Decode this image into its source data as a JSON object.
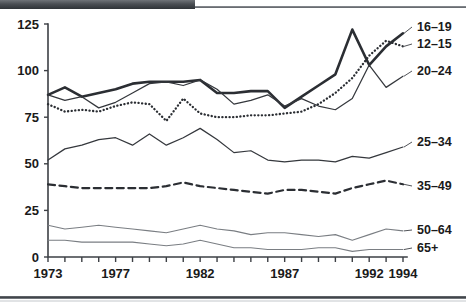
{
  "figure": {
    "title": "",
    "y_axis": {
      "ticks": [
        "0",
        "25",
        "50",
        "75",
        "100",
        "125"
      ],
      "min": 0,
      "max": 125
    },
    "x_axis": {
      "labeled_ticks": [
        "1973",
        "1977",
        "1982",
        "1987",
        "1992",
        "1994"
      ],
      "min": 1973,
      "max": 1994
    },
    "legend": [
      {
        "label": "16–19"
      },
      {
        "label": "12–15"
      },
      {
        "label": "20–24"
      },
      {
        "label": "25–34"
      },
      {
        "label": "35–49"
      },
      {
        "label": "50–64"
      },
      {
        "label": "65+"
      }
    ],
    "colors": {
      "ink": "#1a1a1a",
      "axis": "#3d4045",
      "light_line": "#6d7176",
      "background": "#ffffff"
    }
  },
  "chart_data": {
    "type": "line",
    "title": "",
    "xlabel": "",
    "ylabel": "",
    "xlim": [
      1973,
      1994
    ],
    "ylim": [
      0,
      125
    ],
    "grid": false,
    "legend_position": "right",
    "x": [
      1973,
      1974,
      1975,
      1976,
      1977,
      1978,
      1979,
      1980,
      1981,
      1982,
      1983,
      1984,
      1985,
      1986,
      1987,
      1988,
      1989,
      1990,
      1991,
      1992,
      1993,
      1994
    ],
    "series": [
      {
        "name": "16–19",
        "style": "solid-thick",
        "values": [
          87,
          91,
          86,
          88,
          90,
          93,
          94,
          94,
          94,
          95,
          88,
          88,
          89,
          89,
          80,
          86,
          92,
          98,
          122,
          103,
          113,
          120
        ]
      },
      {
        "name": "12–15",
        "style": "dotted",
        "values": [
          82,
          78,
          79,
          78,
          81,
          83,
          82,
          73,
          85,
          77,
          75,
          75,
          76,
          76,
          77,
          78,
          82,
          88,
          96,
          108,
          116,
          113
        ]
      },
      {
        "name": "20–24",
        "style": "solid-thin",
        "values": [
          87,
          84,
          86,
          80,
          83,
          88,
          93,
          94,
          92,
          95,
          90,
          82,
          84,
          87,
          81,
          85,
          81,
          79,
          85,
          103,
          91,
          97
        ]
      },
      {
        "name": "25–34",
        "style": "solid-thin",
        "values": [
          52,
          58,
          60,
          63,
          64,
          60,
          66,
          60,
          64,
          69,
          63,
          56,
          57,
          52,
          51,
          52,
          52,
          51,
          54,
          53,
          56,
          59
        ]
      },
      {
        "name": "35–49",
        "style": "dashed",
        "values": [
          39,
          38,
          37,
          37,
          37,
          37,
          37,
          38,
          40,
          38,
          37,
          36,
          35,
          34,
          36,
          36,
          35,
          34,
          37,
          39,
          41,
          39
        ]
      },
      {
        "name": "50–64",
        "style": "solid-thin-light",
        "values": [
          17,
          15,
          16,
          17,
          16,
          15,
          14,
          13,
          15,
          17,
          15,
          14,
          12,
          13,
          13,
          12,
          11,
          12,
          9,
          12,
          15,
          14
        ]
      },
      {
        "name": "65+",
        "style": "solid-thin-light",
        "values": [
          9,
          9,
          8,
          8,
          8,
          8,
          7,
          6,
          7,
          9,
          7,
          5,
          5,
          4,
          4,
          4,
          5,
          5,
          3,
          4,
          4,
          4
        ]
      }
    ]
  }
}
